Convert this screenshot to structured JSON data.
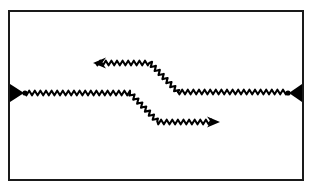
{
  "figure": {
    "kind": "feynman-diagram",
    "title": "",
    "caption": "",
    "background_color": "#ffffff",
    "ink_color": "#000000",
    "frame": {
      "name": "figure-border",
      "stroke_color": "#1a1a1a",
      "stroke_width": 2,
      "x": 9,
      "y": 11,
      "width": 294,
      "height": 169
    },
    "wave": {
      "period": 5.6,
      "amplitude": 2.3,
      "stroke_width": 2.1,
      "stroke_color": "#000000"
    },
    "vertices": [
      {
        "name": "left-vertex",
        "x": 25,
        "y": 93,
        "radius": 2.6
      },
      {
        "name": "right-vertex",
        "x": 288,
        "y": 93,
        "radius": 2.6
      }
    ],
    "terminals": [
      {
        "name": "left-external-terminal",
        "shape": "filled-triangle",
        "direction": "right",
        "tip_x": 24,
        "base_x": 10,
        "y": 93,
        "half_height": 9
      },
      {
        "name": "right-external-terminal",
        "shape": "filled-triangle",
        "direction": "left",
        "tip_x": 289,
        "base_x": 302,
        "y": 93,
        "half_height": 9
      }
    ],
    "lines": [
      {
        "name": "incoming-wavy-line",
        "style": "wavy",
        "points": [
          [
            25,
            93
          ],
          [
            130,
            93
          ]
        ]
      },
      {
        "name": "lower-branch-wavy-line",
        "style": "wavy",
        "points": [
          [
            130,
            93
          ],
          [
            158,
            122
          ],
          [
            213,
            122
          ]
        ]
      },
      {
        "name": "upper-branch-wavy-line",
        "style": "wavy",
        "points": [
          [
            96,
            63
          ],
          [
            150,
            63
          ],
          [
            178,
            92
          ]
        ]
      },
      {
        "name": "outgoing-wavy-line",
        "style": "wavy",
        "points": [
          [
            178,
            92
          ],
          [
            288,
            92
          ]
        ]
      }
    ],
    "arrowheads": [
      {
        "name": "upper-branch-arrowhead",
        "direction": "left",
        "tip_x": 93,
        "y": 63,
        "length": 13,
        "half_height": 5.5
      },
      {
        "name": "lower-branch-arrowhead",
        "direction": "right",
        "tip_x": 220,
        "y": 122,
        "length": 13,
        "half_height": 5.5
      }
    ]
  }
}
